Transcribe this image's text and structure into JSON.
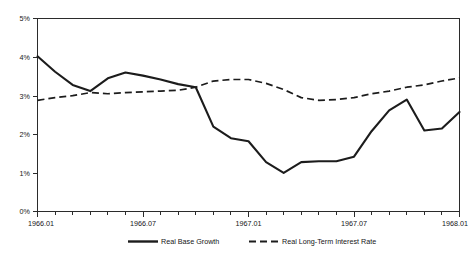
{
  "chart_data": {
    "type": "line",
    "title": "",
    "subtitle": "",
    "xlabel": "",
    "ylabel": "",
    "ylim": [
      0,
      5
    ],
    "ytick_labels": [
      "0%",
      "1%",
      "2%",
      "3%",
      "4%",
      "5%"
    ],
    "ytick_values": [
      0,
      1,
      2,
      3,
      4,
      5
    ],
    "xtick_labels": [
      "1966.01",
      "1966.07",
      "1967.01",
      "1967.07",
      "1968.01"
    ],
    "xtick_label_positions": [
      0,
      6,
      12,
      18,
      24
    ],
    "x": [
      "1966.01",
      "1966.02",
      "1966.03",
      "1966.04",
      "1966.05",
      "1966.06",
      "1966.07",
      "1966.08",
      "1966.09",
      "1966.10",
      "1966.11",
      "1966.12",
      "1967.01",
      "1967.02",
      "1967.03",
      "1967.04",
      "1967.05",
      "1967.06",
      "1967.07",
      "1967.08",
      "1967.09",
      "1967.10",
      "1967.11",
      "1967.12",
      "1968.01"
    ],
    "xlim": [
      0,
      24
    ],
    "minor_ticks_per_label": 1,
    "grid": false,
    "legend_position": "bottom",
    "series": [
      {
        "name": "Real Base Growth",
        "style": "solid",
        "color": "#1c1c1c",
        "values": [
          4.02,
          3.62,
          3.28,
          3.12,
          3.45,
          3.6,
          3.5,
          3.38,
          3.28,
          3.2,
          2.22,
          1.92,
          1.85,
          1.3,
          1.0,
          1.28,
          1.3,
          1.32,
          1.42,
          2.05,
          2.62,
          2.88,
          2.1,
          2.15,
          2.58
        ]
      },
      {
        "name": "Real Long-Term Interest Rate",
        "style": "dashed",
        "color": "#1c1c1c",
        "values": [
          2.88,
          2.95,
          3.0,
          3.05,
          3.02,
          3.05,
          3.08,
          3.12,
          3.12,
          3.2,
          3.35,
          3.4,
          3.42,
          3.32,
          3.18,
          2.92,
          2.88,
          2.9,
          2.95,
          3.02,
          3.1,
          3.2,
          3.25,
          3.35,
          3.45
        ]
      }
    ],
    "solid_points": [
      [
        0,
        4.02
      ],
      [
        1,
        3.62
      ],
      [
        2,
        3.28
      ],
      [
        3,
        3.12
      ],
      [
        4,
        3.45
      ],
      [
        5,
        3.6
      ],
      [
        6,
        3.52
      ],
      [
        7,
        3.42
      ],
      [
        8,
        3.3
      ],
      [
        9,
        3.22
      ],
      [
        10,
        2.2
      ],
      [
        11,
        1.9
      ],
      [
        12,
        1.82
      ],
      [
        13,
        1.28
      ],
      [
        14,
        1.0
      ],
      [
        15,
        1.28
      ],
      [
        16,
        1.3
      ],
      [
        17,
        1.3
      ],
      [
        18,
        1.42
      ],
      [
        19,
        2.08
      ],
      [
        20,
        2.62
      ],
      [
        21,
        2.9
      ],
      [
        22,
        2.1
      ],
      [
        23,
        2.15
      ],
      [
        24,
        2.58
      ]
    ],
    "dashed_points": [
      [
        0,
        2.88
      ],
      [
        1,
        2.95
      ],
      [
        2,
        3.0
      ],
      [
        3,
        3.08
      ],
      [
        4,
        3.05
      ],
      [
        5,
        3.08
      ],
      [
        6,
        3.1
      ],
      [
        7,
        3.12
      ],
      [
        8,
        3.14
      ],
      [
        9,
        3.22
      ],
      [
        10,
        3.38
      ],
      [
        11,
        3.42
      ],
      [
        12,
        3.42
      ],
      [
        13,
        3.32
      ],
      [
        14,
        3.16
      ],
      [
        15,
        2.95
      ],
      [
        16,
        2.88
      ],
      [
        17,
        2.9
      ],
      [
        18,
        2.95
      ],
      [
        19,
        3.05
      ],
      [
        20,
        3.12
      ],
      [
        21,
        3.22
      ],
      [
        22,
        3.28
      ],
      [
        23,
        3.38
      ],
      [
        24,
        3.46
      ]
    ]
  },
  "legend": {
    "entries": [
      {
        "label": "Real Base Growth",
        "style": "solid"
      },
      {
        "label": "Real Long-Term Interest Rate",
        "style": "dashed"
      }
    ]
  },
  "axes": {
    "y_labels": [
      "5%",
      "4%",
      "3%",
      "2%",
      "1%",
      "0%"
    ],
    "x_labels": [
      "1966.01",
      "1966.07",
      "1967.01",
      "1967.07",
      "1968.01"
    ]
  }
}
